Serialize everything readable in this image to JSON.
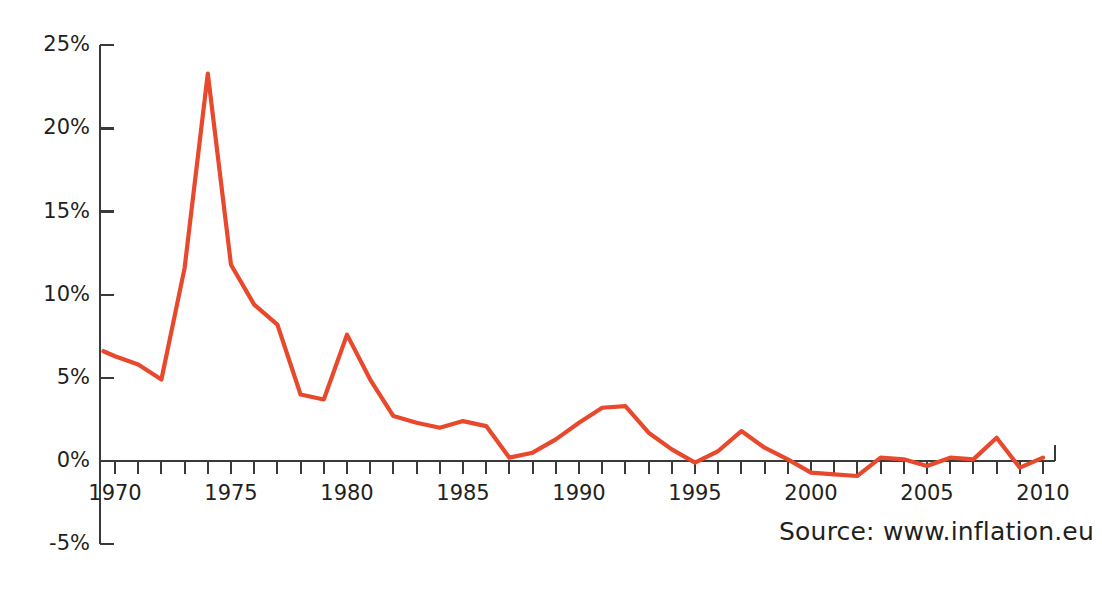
{
  "title_remnant": "",
  "source_note": "Source: www.inflation.eu",
  "axes": {
    "y_tick_labels": [
      "25%",
      "20%",
      "15%",
      "10%",
      "5%",
      "0%",
      "-5%"
    ],
    "x_tick_labels": [
      "1970",
      "1975",
      "1980",
      "1985",
      "1990",
      "1995",
      "2000",
      "2005",
      "2010"
    ]
  },
  "colors": {
    "line": "#E8482B",
    "axis": "#3a3a3a",
    "text": "#231f20",
    "background": "#ffffff"
  },
  "chart_data": {
    "type": "line",
    "title": "",
    "subtitle": "",
    "xlabel": "",
    "ylabel": "",
    "xlim": [
      1969.5,
      2010.5
    ],
    "ylim": [
      -5,
      25
    ],
    "grid": false,
    "legend": false,
    "y_unit": "percent",
    "y_ticks": [
      -5,
      0,
      5,
      10,
      15,
      20,
      25
    ],
    "y_tick_labels": [
      "-5%",
      "0%",
      "5%",
      "10%",
      "15%",
      "20%",
      "25%"
    ],
    "x_ticks": [
      1970,
      1975,
      1980,
      1985,
      1990,
      1995,
      2000,
      2005,
      2010
    ],
    "x_minor_tick_interval": 1,
    "series": [
      {
        "name": "Inflation rate",
        "color": "#E8482B",
        "x": [
          1969.5,
          1970,
          1971,
          1972,
          1973,
          1974,
          1975,
          1976,
          1977,
          1978,
          1979,
          1980,
          1981,
          1982,
          1983,
          1984,
          1985,
          1986,
          1987,
          1988,
          1989,
          1990,
          1991,
          1992,
          1993,
          1994,
          1995,
          1996,
          1997,
          1998,
          1999,
          2000,
          2001,
          2002,
          2003,
          2004,
          2005,
          2006,
          2007,
          2008,
          2009,
          2010
        ],
        "y": [
          6.6,
          6.3,
          5.8,
          4.9,
          11.6,
          23.3,
          11.8,
          9.4,
          8.2,
          4.0,
          3.7,
          7.6,
          4.9,
          2.7,
          2.3,
          2.0,
          2.4,
          2.1,
          0.2,
          0.5,
          1.3,
          2.3,
          3.2,
          3.3,
          1.7,
          0.7,
          -0.1,
          0.6,
          1.8,
          0.8,
          0.1,
          -0.7,
          -0.8,
          -0.9,
          0.2,
          0.1,
          -0.3,
          0.2,
          0.1,
          1.4,
          -0.4,
          0.2
        ]
      }
    ]
  }
}
